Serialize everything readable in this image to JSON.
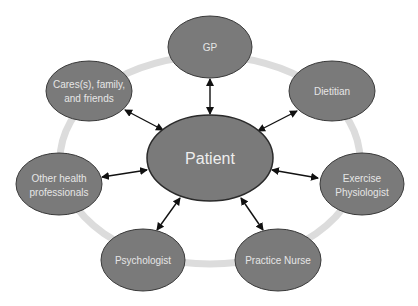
{
  "colors": {
    "node_fill": "#7a7a7a",
    "node_stroke": "#3a3a3a",
    "ring": "#dcdcdc",
    "arrow": "#111111",
    "text": "#e8e8e8"
  },
  "center": {
    "label": "Patient"
  },
  "nodes": [
    {
      "id": "gp",
      "lines": [
        "GP"
      ]
    },
    {
      "id": "dietitian",
      "lines": [
        "Dietitian"
      ]
    },
    {
      "id": "exercise-physiologist",
      "lines": [
        "Exercise",
        "Physiologist"
      ]
    },
    {
      "id": "practice-nurse",
      "lines": [
        "Practice Nurse"
      ]
    },
    {
      "id": "psychologist",
      "lines": [
        "Psychologist"
      ]
    },
    {
      "id": "other-health-professionals",
      "lines": [
        "Other health",
        "professionals"
      ]
    },
    {
      "id": "carers-family-friends",
      "lines": [
        "Cares(s), family,",
        "and friends"
      ]
    }
  ],
  "labels": {
    "gp": "GP",
    "dietitian": "Dietitian",
    "exercise_1": "Exercise",
    "exercise_2": "Physiologist",
    "nurse": "Practice Nurse",
    "psychologist": "Psychologist",
    "other_1": "Other health",
    "other_2": "professionals",
    "carers_1": "Cares(s), family,",
    "carers_2": "and friends"
  }
}
